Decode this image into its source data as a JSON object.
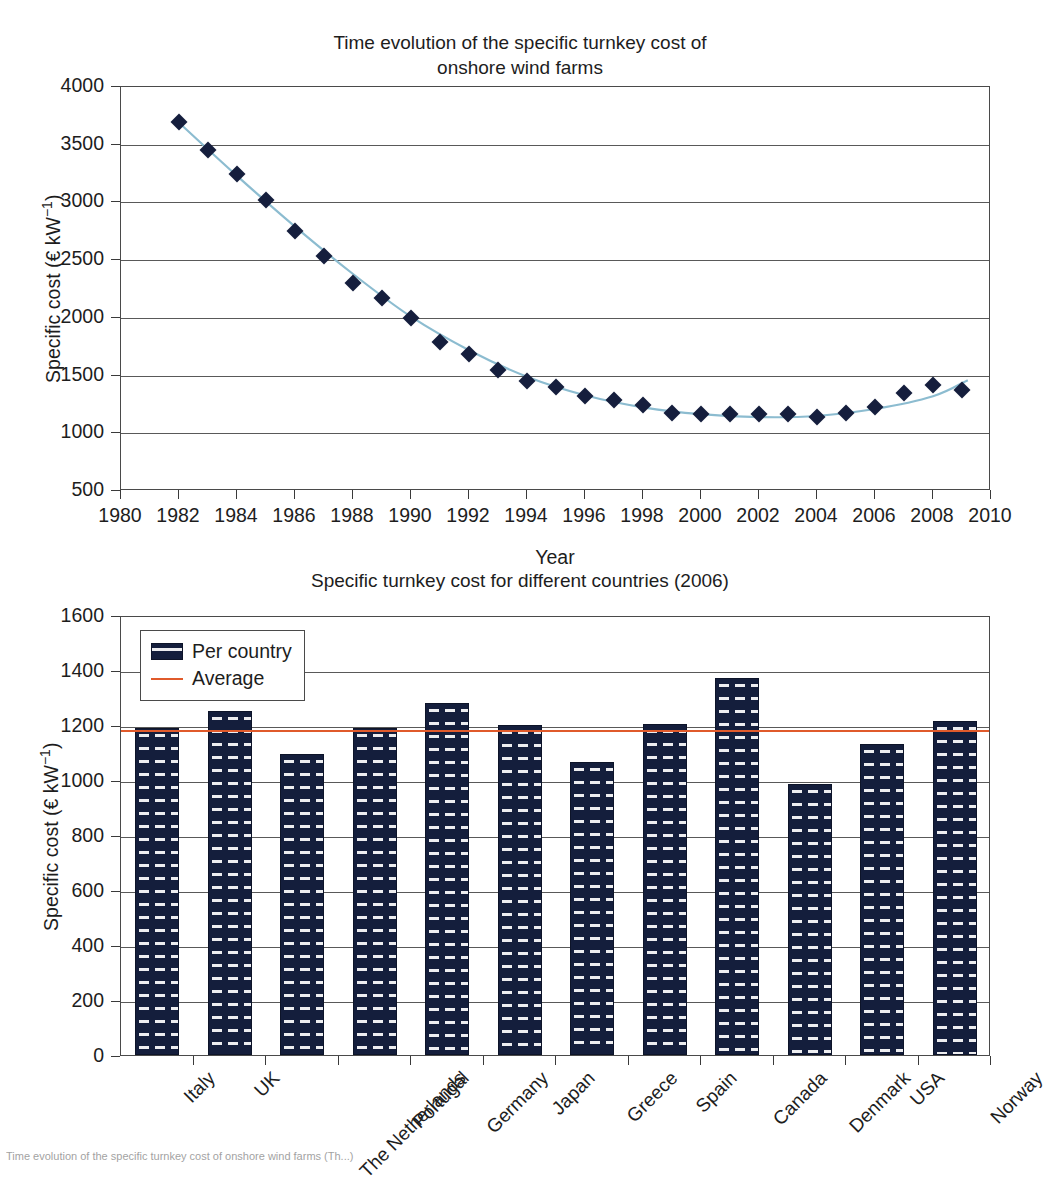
{
  "figure": {
    "caption": "Time evolution of the specific turnkey cost of onshore wind farms (Th...)"
  },
  "chart_data": [
    {
      "id": "top",
      "type": "scatter",
      "title": "Time evolution of the specific turnkey cost of\nonshore wind farms",
      "xlabel": "Year",
      "ylabel_text": "Specific cost (€ kW",
      "ylabel_sup": "−1",
      "ylabel_tail": ")",
      "xlim": [
        1980,
        2010
      ],
      "ylim": [
        500,
        4000
      ],
      "xticks": [
        1980,
        1982,
        1984,
        1986,
        1988,
        1990,
        1992,
        1994,
        1996,
        1998,
        2000,
        2002,
        2004,
        2006,
        2008,
        2010
      ],
      "yticks": [
        500,
        1000,
        1500,
        2000,
        2500,
        3000,
        3500,
        4000
      ],
      "grid": true,
      "legend_position": "none",
      "marker_color": "#151e3d",
      "trend_color": "#8cbcd0",
      "x": [
        1982,
        1983,
        1984,
        1985,
        1986,
        1987,
        1988,
        1989,
        1990,
        1991,
        1992,
        1993,
        1994,
        1995,
        1996,
        1997,
        1998,
        1999,
        2000,
        2001,
        2002,
        2003,
        2004,
        2005,
        2006,
        2007,
        2008,
        2009
      ],
      "y": [
        3700,
        3450,
        3245,
        3020,
        2750,
        2540,
        2305,
        2175,
        2000,
        1790,
        1685,
        1550,
        1450,
        1400,
        1325,
        1285,
        1245,
        1180,
        1165,
        1170,
        1165,
        1165,
        1140,
        1175,
        1225,
        1345,
        1420,
        1375
      ],
      "trend": [
        [
          1982,
          3690
        ],
        [
          1984,
          3230
        ],
        [
          1986,
          2790
        ],
        [
          1988,
          2380
        ],
        [
          1990,
          2010
        ],
        [
          1992,
          1720
        ],
        [
          1994,
          1490
        ],
        [
          1996,
          1330
        ],
        [
          1998,
          1225
        ],
        [
          2000,
          1165
        ],
        [
          2002,
          1140
        ],
        [
          2004,
          1150
        ],
        [
          2006,
          1210
        ],
        [
          2008,
          1320
        ],
        [
          2009.2,
          1460
        ]
      ]
    },
    {
      "id": "bottom",
      "type": "bar",
      "title": "Specific turnkey cost for different countries (2006)",
      "xlabel": "",
      "ylabel_text": "Specific cost (€ kW",
      "ylabel_sup": "−1",
      "ylabel_tail": ")",
      "ylim": [
        0,
        1600
      ],
      "yticks": [
        0,
        200,
        400,
        600,
        800,
        1000,
        1200,
        1400,
        1600
      ],
      "grid": true,
      "legend_position": "upper-left",
      "legend": [
        "Per country",
        "Average"
      ],
      "bar_color": "#141e3c",
      "average_color": "#e05a2b",
      "average": 1190,
      "categories": [
        "Italy",
        "UK",
        "The Netherlands",
        "Portugal",
        "Germany",
        "Japan",
        "Greece",
        "Spain",
        "Canada",
        "Denmark",
        "USA",
        "Norway"
      ],
      "values": [
        1190,
        1250,
        1095,
        1190,
        1280,
        1200,
        1065,
        1205,
        1370,
        985,
        1130,
        1215
      ]
    }
  ]
}
